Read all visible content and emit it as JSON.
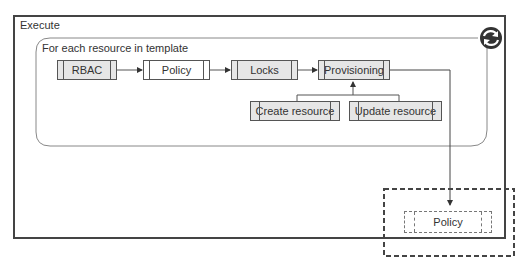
{
  "outer_container": {
    "label": "Execute"
  },
  "loop_container": {
    "label": "For each resource in template",
    "loop_icon": "refresh-cycle-icon"
  },
  "pipeline": [
    {
      "id": "rbac",
      "label": "RBAC",
      "style": "gray"
    },
    {
      "id": "policy",
      "label": "Policy",
      "style": "white"
    },
    {
      "id": "locks",
      "label": "Locks",
      "style": "gray"
    },
    {
      "id": "provisioning",
      "label": "Provisioning",
      "style": "gray"
    }
  ],
  "sub_steps": [
    {
      "id": "create-resource",
      "label": "Create resource"
    },
    {
      "id": "update-resource",
      "label": "Update resource"
    }
  ],
  "external": {
    "label": "Policy",
    "style": "dashed"
  },
  "colors": {
    "line": "#555555",
    "box_fill": "#e6e6e6",
    "icon": "#333333"
  }
}
